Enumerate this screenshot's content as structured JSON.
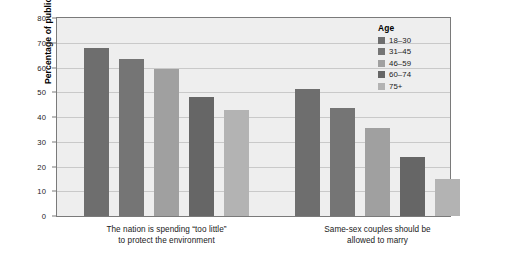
{
  "chart_data": {
    "type": "bar",
    "title": "",
    "subtitle": "",
    "xlabel": "",
    "ylabel": "Percentage of public who feel",
    "ylim": [
      0,
      80
    ],
    "yticks": [
      0,
      10,
      20,
      30,
      40,
      50,
      60,
      70,
      80
    ],
    "ytick_labels": [
      "0",
      "10",
      "20",
      "30",
      "40",
      "50",
      "60",
      "70",
      "80"
    ],
    "grid": true,
    "legend_position": "upper-right-inside",
    "legend_title": "Age",
    "categories": [
      "The nation is spending “too little” to protect the environment",
      "Same-sex couples should be allowed to marry"
    ],
    "category_lines": [
      [
        "The nation is spending “too little”",
        "to protect the environment"
      ],
      [
        "Same-sex couples should be",
        "allowed to marry"
      ]
    ],
    "series": [
      {
        "name": "18–30",
        "color": "#6e6e6e",
        "values": [
          68,
          51.5
        ]
      },
      {
        "name": "31–45",
        "color": "#757575",
        "values": [
          63.5,
          43.5
        ]
      },
      {
        "name": "46–59",
        "color": "#a0a0a0",
        "values": [
          59.5,
          35.5
        ]
      },
      {
        "name": "60–74",
        "color": "#666666",
        "values": [
          48,
          24
        ]
      },
      {
        "name": "75+",
        "color": "#b3b3b3",
        "values": [
          43,
          15
        ]
      }
    ]
  },
  "style": {
    "plot_background": "#eeeeee",
    "page_background": "#ffffff",
    "gridline_color": "#c9c9c9",
    "axis_color": "#7a7a7a",
    "text_color": "#1a1a1a"
  }
}
